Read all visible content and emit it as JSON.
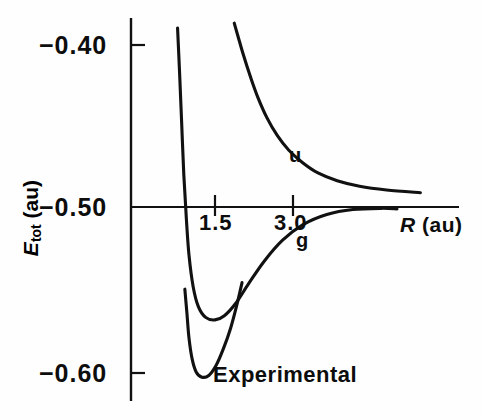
{
  "figure": {
    "background_color": "#fefefe",
    "line_color": "#111111"
  },
  "axes": {
    "y_title_main": "E",
    "y_title_sub": "tot",
    "y_title_unit": " (au)",
    "x_title_main": "R",
    "x_title_unit": " (au)",
    "y_ticks": [
      {
        "value": -0.4,
        "label": "−0.40"
      },
      {
        "value": -0.5,
        "label": "−0.50"
      },
      {
        "value": -0.6,
        "label": "−0.60"
      }
    ],
    "x_ticks": [
      {
        "value": 1.5,
        "label": "1.5"
      },
      {
        "value": 3.0,
        "label": "3.0"
      }
    ]
  },
  "annotations": {
    "u_label": "u",
    "g_label": "g",
    "experimental_label": "Experimental"
  },
  "chart_data": {
    "type": "line",
    "title": "",
    "xlabel": "R (au)",
    "ylabel": "E_tot (au)",
    "xlim": [
      0.0,
      6.4
    ],
    "ylim": [
      -0.625,
      -0.372
    ],
    "grid": false,
    "legend": "inline-curve-labels",
    "x_tick_values": [
      1.5,
      3.0
    ],
    "y_tick_values": [
      -0.4,
      -0.5,
      -0.6
    ],
    "series": [
      {
        "name": "u",
        "label": "u",
        "label_point": {
          "x": 3.15,
          "y": -0.4655
        },
        "points": [
          {
            "x": 1.87,
            "y": -0.3865
          },
          {
            "x": 1.95,
            "y": -0.3955
          },
          {
            "x": 2.05,
            "y": -0.4065
          },
          {
            "x": 2.18,
            "y": -0.4195
          },
          {
            "x": 2.32,
            "y": -0.432
          },
          {
            "x": 2.5,
            "y": -0.445
          },
          {
            "x": 2.7,
            "y": -0.456
          },
          {
            "x": 2.92,
            "y": -0.465
          },
          {
            "x": 3.18,
            "y": -0.4725
          },
          {
            "x": 3.48,
            "y": -0.479
          },
          {
            "x": 3.85,
            "y": -0.4838
          },
          {
            "x": 4.28,
            "y": -0.4872
          },
          {
            "x": 4.8,
            "y": -0.4895
          },
          {
            "x": 5.45,
            "y": -0.4912
          }
        ]
      },
      {
        "name": "g",
        "label": "g",
        "label_point": {
          "x": 3.33,
          "y": -0.5205
        },
        "points": [
          {
            "x": 0.78,
            "y": -0.3895
          },
          {
            "x": 0.82,
            "y": -0.418
          },
          {
            "x": 0.86,
            "y": -0.449
          },
          {
            "x": 0.9,
            "y": -0.48
          },
          {
            "x": 0.95,
            "y": -0.5075
          },
          {
            "x": 1.0,
            "y": -0.529
          },
          {
            "x": 1.08,
            "y": -0.548
          },
          {
            "x": 1.18,
            "y": -0.56
          },
          {
            "x": 1.32,
            "y": -0.5665
          },
          {
            "x": 1.5,
            "y": -0.568
          },
          {
            "x": 1.68,
            "y": -0.5655
          },
          {
            "x": 1.9,
            "y": -0.558
          },
          {
            "x": 2.15,
            "y": -0.546
          },
          {
            "x": 2.45,
            "y": -0.5325
          },
          {
            "x": 2.8,
            "y": -0.52
          },
          {
            "x": 3.2,
            "y": -0.5105
          },
          {
            "x": 3.65,
            "y": -0.5045
          },
          {
            "x": 4.15,
            "y": -0.5015
          },
          {
            "x": 4.7,
            "y": -0.5008
          },
          {
            "x": 5.0,
            "y": -0.5012
          }
        ]
      },
      {
        "name": "Experimental",
        "label": "Experimental",
        "label_point": {
          "x": 2.3,
          "y": -0.603
        },
        "points": [
          {
            "x": 0.92,
            "y": -0.5495
          },
          {
            "x": 0.96,
            "y": -0.564
          },
          {
            "x": 1.0,
            "y": -0.579
          },
          {
            "x": 1.06,
            "y": -0.5915
          },
          {
            "x": 1.14,
            "y": -0.5995
          },
          {
            "x": 1.25,
            "y": -0.6025
          },
          {
            "x": 1.38,
            "y": -0.6015
          },
          {
            "x": 1.52,
            "y": -0.5955
          },
          {
            "x": 1.66,
            "y": -0.5855
          },
          {
            "x": 1.8,
            "y": -0.573
          },
          {
            "x": 1.92,
            "y": -0.559
          },
          {
            "x": 2.02,
            "y": -0.5455
          }
        ]
      }
    ]
  }
}
